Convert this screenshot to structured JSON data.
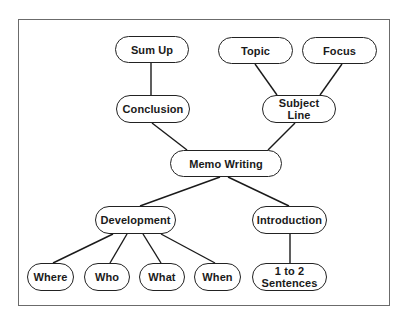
{
  "diagram": {
    "root": "Memo Writing",
    "nodes": {
      "sum_up": "Sum Up",
      "topic": "Topic",
      "focus": "Focus",
      "conclusion": "Conclusion",
      "subject_line": "Subject\nLine",
      "memo_writing": "Memo Writing",
      "development": "Development",
      "introduction": "Introduction",
      "where": "Where",
      "who": "Who",
      "what": "What",
      "when": "When",
      "sentences": "1 to 2\nSentences"
    },
    "edges": [
      [
        "Memo Writing",
        "Conclusion"
      ],
      [
        "Memo Writing",
        "Subject Line"
      ],
      [
        "Memo Writing",
        "Development"
      ],
      [
        "Memo Writing",
        "Introduction"
      ],
      [
        "Conclusion",
        "Sum Up"
      ],
      [
        "Subject Line",
        "Topic"
      ],
      [
        "Subject Line",
        "Focus"
      ],
      [
        "Development",
        "Where"
      ],
      [
        "Development",
        "Who"
      ],
      [
        "Development",
        "What"
      ],
      [
        "Development",
        "When"
      ],
      [
        "Introduction",
        "1 to 2 Sentences"
      ]
    ]
  }
}
